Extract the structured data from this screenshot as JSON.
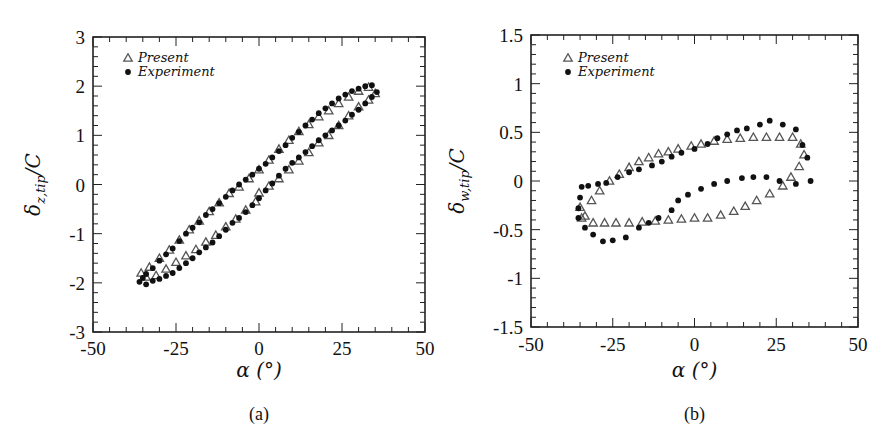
{
  "figure": {
    "panels": [
      {
        "caption": "(a)",
        "xlabel": "α (°)",
        "ylabel_main": "δ",
        "ylabel_sub": "z,tip",
        "ylabel_tail": "/C",
        "legend": [
          {
            "marker": "triangle-open",
            "label": "Present"
          },
          {
            "marker": "circle-filled",
            "label": "Experiment"
          }
        ]
      },
      {
        "caption": "(b)",
        "xlabel": "α (°)",
        "ylabel_main": "δ",
        "ylabel_sub": "w,tip",
        "ylabel_tail": "/C",
        "legend": [
          {
            "marker": "triangle-open",
            "label": "Present"
          },
          {
            "marker": "circle-filled",
            "label": "Experiment"
          }
        ]
      }
    ]
  },
  "chart_data": [
    {
      "type": "scatter",
      "title": "(a)",
      "xlabel": "α (°)",
      "ylabel": "δ_{z,tip}/C",
      "xlim": [
        -50,
        50
      ],
      "ylim": [
        -3,
        3
      ],
      "xticks": [
        -50,
        -25,
        0,
        25,
        50
      ],
      "yticks": [
        -3,
        -2,
        -1,
        0,
        1,
        2,
        3
      ],
      "x_minor_step": 5,
      "y_minor_step": 0.2,
      "grid": false,
      "legend_position": "upper left",
      "series": [
        {
          "name": "Present",
          "marker": "triangle-open",
          "color": "#555555",
          "points": [
            [
              -35.5,
              -1.8
            ],
            [
              -33,
              -1.68
            ],
            [
              -30,
              -1.5
            ],
            [
              -27,
              -1.33
            ],
            [
              -24,
              -1.13
            ],
            [
              -21,
              -0.92
            ],
            [
              -18,
              -0.74
            ],
            [
              -15,
              -0.55
            ],
            [
              -12,
              -0.37
            ],
            [
              -9,
              -0.18
            ],
            [
              -6,
              -0.05
            ],
            [
              -3,
              0.12
            ],
            [
              0,
              0.3
            ],
            [
              3,
              0.5
            ],
            [
              6,
              0.72
            ],
            [
              9,
              0.9
            ],
            [
              12,
              1.08
            ],
            [
              15,
              1.22
            ],
            [
              18,
              1.38
            ],
            [
              21,
              1.5
            ],
            [
              24,
              1.65
            ],
            [
              27,
              1.78
            ],
            [
              30,
              1.9
            ],
            [
              33,
              1.98
            ],
            [
              35,
              1.85
            ],
            [
              33,
              1.72
            ],
            [
              30,
              1.58
            ],
            [
              27,
              1.4
            ],
            [
              24,
              1.2
            ],
            [
              21,
              1.0
            ],
            [
              18,
              0.85
            ],
            [
              15,
              0.65
            ],
            [
              12,
              0.48
            ],
            [
              9,
              0.3
            ],
            [
              6,
              0.12
            ],
            [
              3,
              -0.03
            ],
            [
              0,
              -0.17
            ],
            [
              -1,
              -0.35
            ],
            [
              -4,
              -0.52
            ],
            [
              -7,
              -0.7
            ],
            [
              -10,
              -0.86
            ],
            [
              -13,
              -1.03
            ],
            [
              -16,
              -1.17
            ],
            [
              -19,
              -1.32
            ],
            [
              -22,
              -1.45
            ],
            [
              -25,
              -1.58
            ],
            [
              -28,
              -1.72
            ],
            [
              -31,
              -1.85
            ],
            [
              -34,
              -1.88
            ]
          ]
        },
        {
          "name": "Experiment",
          "marker": "circle-filled",
          "color": "#111111",
          "points": [
            [
              -36,
              -1.98
            ],
            [
              -35,
              -1.9
            ],
            [
              -34,
              -1.82
            ],
            [
              -32,
              -1.7
            ],
            [
              -30,
              -1.55
            ],
            [
              -28,
              -1.42
            ],
            [
              -26,
              -1.3
            ],
            [
              -24,
              -1.15
            ],
            [
              -22,
              -1.0
            ],
            [
              -20,
              -0.88
            ],
            [
              -18,
              -0.77
            ],
            [
              -16,
              -0.62
            ],
            [
              -14,
              -0.5
            ],
            [
              -12,
              -0.38
            ],
            [
              -10,
              -0.25
            ],
            [
              -8,
              -0.12
            ],
            [
              -6,
              0.0
            ],
            [
              -4,
              0.1
            ],
            [
              -2,
              0.2
            ],
            [
              0,
              0.32
            ],
            [
              2,
              0.42
            ],
            [
              4,
              0.55
            ],
            [
              6,
              0.68
            ],
            [
              8,
              0.8
            ],
            [
              10,
              0.95
            ],
            [
              12,
              1.07
            ],
            [
              14,
              1.2
            ],
            [
              16,
              1.32
            ],
            [
              18,
              1.45
            ],
            [
              20,
              1.55
            ],
            [
              22,
              1.65
            ],
            [
              24,
              1.75
            ],
            [
              26,
              1.83
            ],
            [
              28,
              1.9
            ],
            [
              30,
              1.95
            ],
            [
              32,
              2.0
            ],
            [
              34,
              2.02
            ],
            [
              35.5,
              1.88
            ],
            [
              34,
              1.78
            ],
            [
              32,
              1.65
            ],
            [
              30,
              1.52
            ],
            [
              28,
              1.42
            ],
            [
              26,
              1.3
            ],
            [
              24,
              1.2
            ],
            [
              22,
              1.1
            ],
            [
              20,
              1.0
            ],
            [
              18,
              0.9
            ],
            [
              16,
              0.78
            ],
            [
              14,
              0.66
            ],
            [
              12,
              0.55
            ],
            [
              10,
              0.44
            ],
            [
              8,
              0.32
            ],
            [
              6,
              0.18
            ],
            [
              4,
              0.02
            ],
            [
              2,
              -0.12
            ],
            [
              0,
              -0.28
            ],
            [
              -2,
              -0.42
            ],
            [
              -4,
              -0.56
            ],
            [
              -6,
              -0.68
            ],
            [
              -8,
              -0.78
            ],
            [
              -10,
              -0.92
            ],
            [
              -12,
              -1.05
            ],
            [
              -14,
              -1.18
            ],
            [
              -16,
              -1.28
            ],
            [
              -18,
              -1.38
            ],
            [
              -20,
              -1.5
            ],
            [
              -22,
              -1.6
            ],
            [
              -24,
              -1.7
            ],
            [
              -26,
              -1.8
            ],
            [
              -28,
              -1.86
            ],
            [
              -30,
              -1.92
            ],
            [
              -32,
              -1.96
            ],
            [
              -34,
              -2.03
            ]
          ]
        }
      ]
    },
    {
      "type": "scatter",
      "title": "(b)",
      "xlabel": "α (°)",
      "ylabel": "δ_{w,tip}/C",
      "xlim": [
        -50,
        50
      ],
      "ylim": [
        -1.5,
        1.5
      ],
      "xticks": [
        -50,
        -25,
        0,
        25,
        50
      ],
      "yticks": [
        -1.5,
        -1,
        -0.5,
        0,
        0.5,
        1,
        1.5
      ],
      "x_minor_step": 5,
      "y_minor_step": 0.1,
      "grid": false,
      "legend_position": "upper left",
      "series": [
        {
          "name": "Present",
          "marker": "triangle-open",
          "color": "#555555",
          "points": [
            [
              -34.5,
              -0.38
            ],
            [
              -31.5,
              -0.2
            ],
            [
              -29,
              -0.1
            ],
            [
              -26,
              0.0
            ],
            [
              -23,
              0.07
            ],
            [
              -20,
              0.14
            ],
            [
              -17,
              0.2
            ],
            [
              -14,
              0.24
            ],
            [
              -11,
              0.28
            ],
            [
              -8,
              0.3
            ],
            [
              -5,
              0.33
            ],
            [
              -1,
              0.36
            ],
            [
              2,
              0.38
            ],
            [
              6,
              0.41
            ],
            [
              10,
              0.43
            ],
            [
              14,
              0.44
            ],
            [
              18,
              0.45
            ],
            [
              22,
              0.45
            ],
            [
              26,
              0.45
            ],
            [
              30,
              0.45
            ],
            [
              32.5,
              0.38
            ],
            [
              33.5,
              0.27
            ],
            [
              32,
              0.15
            ],
            [
              29.5,
              0.04
            ],
            [
              27,
              -0.05
            ],
            [
              23,
              -0.13
            ],
            [
              19,
              -0.2
            ],
            [
              15.5,
              -0.26
            ],
            [
              12,
              -0.31
            ],
            [
              8,
              -0.35
            ],
            [
              4,
              -0.38
            ],
            [
              0,
              -0.38
            ],
            [
              -4,
              -0.39
            ],
            [
              -8,
              -0.4
            ],
            [
              -12,
              -0.41
            ],
            [
              -16,
              -0.42
            ],
            [
              -20,
              -0.43
            ],
            [
              -24,
              -0.43
            ],
            [
              -27.5,
              -0.43
            ],
            [
              -31,
              -0.43
            ],
            [
              -33.5,
              -0.36
            ],
            [
              -35,
              -0.27
            ]
          ]
        },
        {
          "name": "Experiment",
          "marker": "circle-filled",
          "color": "#111111",
          "points": [
            [
              -35.5,
              -0.28
            ],
            [
              -35,
              -0.17
            ],
            [
              -34.5,
              -0.06
            ],
            [
              -32.5,
              -0.05
            ],
            [
              -29.5,
              -0.03
            ],
            [
              -27,
              -0.02
            ],
            [
              -23.5,
              0.04
            ],
            [
              -20,
              0.09
            ],
            [
              -17,
              0.12
            ],
            [
              -13,
              0.16
            ],
            [
              -10,
              0.2
            ],
            [
              -7,
              0.25
            ],
            [
              -4,
              0.29
            ],
            [
              0,
              0.33
            ],
            [
              4,
              0.38
            ],
            [
              7,
              0.44
            ],
            [
              10,
              0.48
            ],
            [
              13,
              0.52
            ],
            [
              16,
              0.54
            ],
            [
              20,
              0.58
            ],
            [
              23,
              0.62
            ],
            [
              27,
              0.58
            ],
            [
              31,
              0.53
            ],
            [
              33,
              0.37
            ],
            [
              34.5,
              0.24
            ],
            [
              35.5,
              0.0
            ],
            [
              31,
              -0.03
            ],
            [
              26,
              0.0
            ],
            [
              22,
              0.04
            ],
            [
              18,
              0.04
            ],
            [
              14.5,
              0.03
            ],
            [
              10,
              0.0
            ],
            [
              6,
              -0.03
            ],
            [
              2,
              -0.08
            ],
            [
              -2,
              -0.14
            ],
            [
              -5,
              -0.2
            ],
            [
              -7,
              -0.3
            ],
            [
              -11,
              -0.38
            ],
            [
              -14,
              -0.43
            ],
            [
              -17,
              -0.48
            ],
            [
              -21,
              -0.58
            ],
            [
              -25,
              -0.61
            ],
            [
              -28,
              -0.62
            ],
            [
              -31,
              -0.55
            ],
            [
              -33.5,
              -0.48
            ],
            [
              -35.5,
              -0.38
            ]
          ]
        }
      ]
    }
  ]
}
